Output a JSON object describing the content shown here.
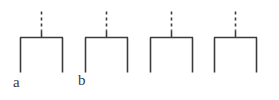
{
  "figure": {
    "title": "",
    "background_color": "#ffffff",
    "stroke_color": "#3c3c3c",
    "stroke_width": 1.6,
    "dash_pattern": "3 3",
    "canvas": {
      "width": 279,
      "height": 100
    }
  },
  "shapes": [
    {
      "id": "shape-1",
      "name": "bridge-unit-a",
      "bar": {
        "x1": 20,
        "x2": 63,
        "y": 37.5
      },
      "left_leg": {
        "x": 20.5,
        "y1": 37.5,
        "y2": 72.5
      },
      "right_leg": {
        "x": 62.5,
        "y1": 37.5,
        "y2": 72.5
      },
      "stem": {
        "x": 41.5,
        "y_top": 11.5,
        "y_bottom": 37.5,
        "style": "dashed"
      },
      "label": {
        "text": "a",
        "x": 13,
        "y": 75
      }
    },
    {
      "id": "shape-2",
      "name": "bridge-unit-b",
      "bar": {
        "x1": 85,
        "x2": 128,
        "y": 37.5
      },
      "left_leg": {
        "x": 85.5,
        "y1": 37.5,
        "y2": 72.5
      },
      "right_leg": {
        "x": 127.5,
        "y1": 37.5,
        "y2": 72.5
      },
      "stem": {
        "x": 106.5,
        "y_top": 11.5,
        "y_bottom": 37.5,
        "style": "dashed"
      },
      "label": {
        "text": "b",
        "x": 78,
        "y": 73
      }
    },
    {
      "id": "shape-3",
      "name": "bridge-unit-3",
      "bar": {
        "x1": 150,
        "x2": 193,
        "y": 37.5
      },
      "left_leg": {
        "x": 150.5,
        "y1": 37.5,
        "y2": 72.5
      },
      "right_leg": {
        "x": 192.5,
        "y1": 37.5,
        "y2": 72.5
      },
      "stem": {
        "x": 171.5,
        "y_top": 11.5,
        "y_bottom": 37.5,
        "style": "dashed"
      },
      "label": {
        "text": "",
        "x": 0,
        "y": 0
      }
    },
    {
      "id": "shape-4",
      "name": "bridge-unit-4",
      "bar": {
        "x1": 214,
        "x2": 257,
        "y": 37.5
      },
      "left_leg": {
        "x": 214.5,
        "y1": 37.5,
        "y2": 72.5
      },
      "right_leg": {
        "x": 256.5,
        "y1": 37.5,
        "y2": 72.5
      },
      "stem": {
        "x": 235.5,
        "y_top": 11.5,
        "y_bottom": 37.5,
        "style": "dashed"
      },
      "label": {
        "text": "",
        "x": 0,
        "y": 0
      }
    }
  ],
  "labels": [
    {
      "key": "label-a",
      "text": "a"
    },
    {
      "key": "label-b",
      "text": "b"
    }
  ]
}
